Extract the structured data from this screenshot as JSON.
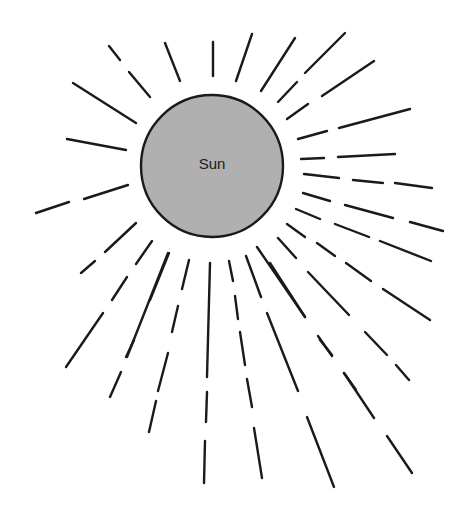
{
  "sun": {
    "label": "Sun",
    "cx": 212,
    "cy": 166,
    "r": 71,
    "fill": "#b0b0b0",
    "stroke": "#1a1a1a"
  },
  "rays": [
    [
      [
        73,
        83,
        136,
        123
      ]
    ],
    [
      [
        109,
        46,
        120,
        60
      ],
      [
        129,
        72,
        150,
        97
      ]
    ],
    [
      [
        165,
        43,
        180,
        81
      ]
    ],
    [
      [
        213,
        42,
        213,
        76
      ]
    ],
    [
      [
        252,
        34,
        236,
        81
      ]
    ],
    [
      [
        295,
        38,
        261,
        91
      ]
    ],
    [
      [
        345,
        33,
        305,
        73
      ],
      [
        297,
        82,
        278,
        102
      ]
    ],
    [
      [
        374,
        61,
        322,
        96
      ]
    ],
    [
      [
        308,
        104,
        287,
        119
      ]
    ],
    [
      [
        410,
        109,
        339,
        128
      ],
      [
        327,
        131,
        298,
        139
      ]
    ],
    [
      [
        395,
        154,
        338,
        157
      ],
      [
        324,
        158,
        301,
        159
      ]
    ],
    [
      [
        432,
        188,
        395,
        183
      ],
      [
        383,
        183,
        353,
        180
      ],
      [
        339,
        178,
        304,
        174
      ]
    ],
    [
      [
        443,
        231,
        410,
        222
      ],
      [
        393,
        218,
        345,
        205
      ],
      [
        330,
        201,
        303,
        193
      ]
    ],
    [
      [
        431,
        261,
        380,
        241
      ],
      [
        369,
        237,
        335,
        224
      ],
      [
        320,
        219,
        296,
        209
      ]
    ],
    [
      [
        430,
        320,
        383,
        289
      ],
      [
        371,
        281,
        346,
        263
      ],
      [
        335,
        256,
        317,
        243
      ],
      [
        305,
        237,
        287,
        224
      ]
    ],
    [
      [
        409,
        380,
        396,
        365
      ],
      [
        387,
        355,
        365,
        332
      ],
      [
        349,
        315,
        308,
        272
      ],
      [
        296,
        258,
        278,
        238
      ]
    ],
    [
      [
        356,
        390,
        344,
        373
      ],
      [
        332,
        356,
        318,
        336
      ],
      [
        305,
        317,
        270,
        263
      ]
    ],
    [
      [
        412,
        473,
        387,
        436
      ],
      [
        374,
        418,
        344,
        373
      ],
      [
        332,
        355,
        320,
        340
      ],
      [
        305,
        317,
        257,
        247
      ]
    ],
    [
      [
        334,
        487,
        307,
        417
      ],
      [
        298,
        391,
        267,
        313
      ],
      [
        261,
        297,
        246,
        256
      ]
    ],
    [
      [
        262,
        478,
        254,
        428
      ],
      [
        252,
        407,
        247,
        379
      ],
      [
        245,
        365,
        240,
        332
      ],
      [
        238,
        319,
        235,
        296
      ],
      [
        233,
        281,
        229,
        261
      ]
    ],
    [
      [
        204,
        483,
        205,
        441
      ],
      [
        206,
        422,
        207,
        392
      ],
      [
        207,
        377,
        210,
        263
      ]
    ],
    [
      [
        149,
        432,
        156,
        401
      ],
      [
        158,
        391,
        168,
        353
      ],
      [
        172,
        332,
        178,
        306
      ],
      [
        182,
        289,
        189,
        260
      ]
    ],
    [
      [
        110,
        397,
        121,
        372
      ],
      [
        126,
        357,
        134,
        340
      ],
      [
        127,
        357,
        168,
        253
      ]
    ],
    [
      [
        66,
        367,
        103,
        313
      ],
      [
        112,
        300,
        127,
        277
      ],
      [
        136,
        264,
        152,
        241
      ]
    ],
    [
      [
        81,
        273,
        95,
        261
      ],
      [
        105,
        252,
        136,
        223
      ]
    ],
    [
      [
        150,
        300,
        169,
        253
      ]
    ],
    [
      [
        36,
        213,
        69,
        202
      ],
      [
        84,
        199,
        128,
        185
      ]
    ],
    [
      [
        67,
        139,
        126,
        150
      ]
    ]
  ]
}
